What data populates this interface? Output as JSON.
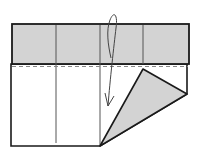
{
  "diagram": {
    "type": "origami-fold-step",
    "colors": {
      "paper_white": "#ffffff",
      "paper_colored": "#d3d3d3",
      "line": "#1a1a1a",
      "crease": "#555555",
      "dashed": "#888888"
    },
    "elements": [
      "colored-top-band",
      "vertical-creases",
      "valley-fold-dashed-line",
      "folded-triangle-flap",
      "fold-arrow"
    ]
  }
}
